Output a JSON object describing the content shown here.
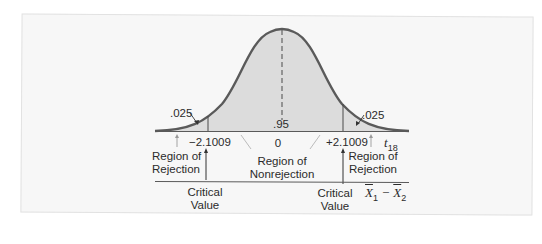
{
  "diagram": {
    "type": "t-distribution two-tailed rejection region",
    "colors": {
      "background": "#f7f7f7",
      "curve": "#5a5a5a",
      "fill": "#dcdcdc",
      "text": "#2b2b2b"
    },
    "tail_area_left": ".025",
    "tail_area_right": ".025",
    "center_area": ".95",
    "critical_left": "−2.1009",
    "center_value": "0",
    "critical_right": "+2.1009",
    "axis_label_t": "t",
    "axis_label_t_sub": "18",
    "axis_label_x_a": "X",
    "axis_label_x_a_sub": "1",
    "axis_label_minus": "−",
    "axis_label_x_b": "X",
    "axis_label_x_b_sub": "2",
    "left_region": {
      "line1": "Region of",
      "line2": "Rejection"
    },
    "center_region": {
      "line1": "Region of",
      "line2": "Nonrejection"
    },
    "right_region": {
      "line1": "Region of",
      "line2": "Rejection"
    },
    "left_critical": {
      "line1": "Critical",
      "line2": "Value"
    },
    "right_critical": {
      "line1": "Critical",
      "line2": "Value"
    }
  }
}
